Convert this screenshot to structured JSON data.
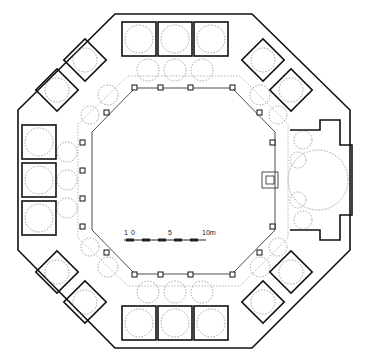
{
  "drawing": {
    "type": "architectural floor plan",
    "shape": "octagonal courtyard building with domed cells",
    "colors": {
      "line": "#111111",
      "dome_outline": "#777777",
      "background": "#ffffff"
    }
  },
  "scale_bar": {
    "labels": [
      "1",
      "0",
      "5",
      "10m"
    ],
    "unit": "m"
  }
}
